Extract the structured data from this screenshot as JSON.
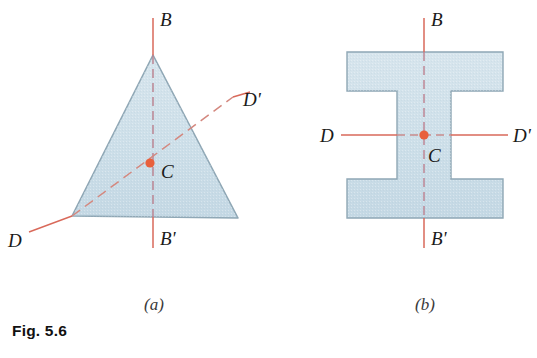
{
  "figure": {
    "caption": "Fig. 5.6",
    "panels": [
      {
        "id": "a",
        "sublabel": "(a)",
        "shape": "equilateral-triangle",
        "axes": [
          {
            "name": "B-B'",
            "top_label": "B",
            "bottom_label": "B'",
            "style": "vertical-dash-dot"
          },
          {
            "name": "D-D'",
            "left_label": "D",
            "right_label": "D'",
            "style": "oblique-dash-dot"
          }
        ],
        "centroid_label": "C"
      },
      {
        "id": "b",
        "sublabel": "(b)",
        "shape": "i-beam-section",
        "axes": [
          {
            "name": "B-B'",
            "top_label": "B",
            "bottom_label": "B'",
            "style": "vertical-dash-dot"
          },
          {
            "name": "D-D'",
            "left_label": "D",
            "right_label": "D'",
            "style": "horizontal-dash-dot"
          }
        ],
        "centroid_label": "C"
      }
    ]
  },
  "labels": {
    "b_top_a": "B",
    "b_bottom_a": "B'",
    "d_left_a": "D",
    "d_right_a": "D'",
    "c_a": "C",
    "b_top_b": "B",
    "b_bottom_b": "B'",
    "d_left_b": "D",
    "d_right_b": "D'",
    "c_b": "C",
    "sub_a": "(a)",
    "sub_b": "(b)"
  },
  "colors": {
    "shape_fill": "#cfdfe8",
    "shape_stroke": "#8fa7b5",
    "axis_line": "#d9695a",
    "centroid_dot": "#e8603c",
    "label_text": "#1a1a1a",
    "caption_text": "#111111",
    "background": "#ffffff"
  }
}
